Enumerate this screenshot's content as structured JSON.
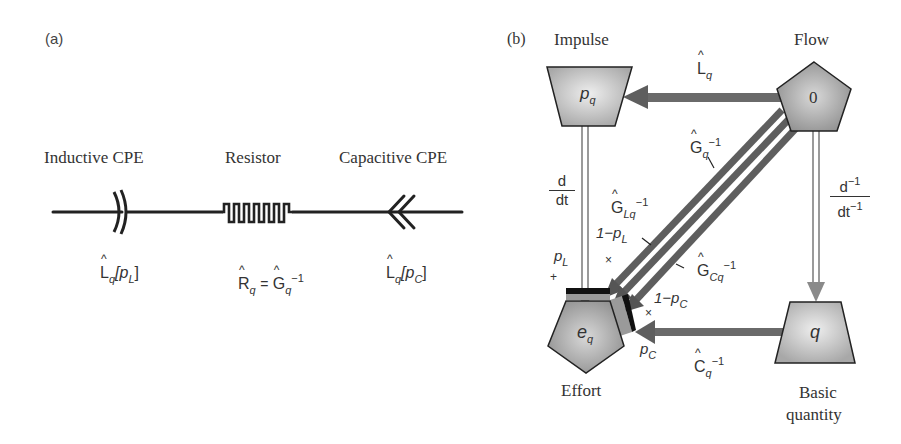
{
  "panel_a": {
    "label": "(a)",
    "elements": [
      {
        "title": "Inductive CPE",
        "symbol": "inductive-cpe",
        "expr_base": "L",
        "expr_sub": "q",
        "expr_arg": "[p",
        "expr_arg_sub": "L",
        "expr_close": "]"
      },
      {
        "title": "Resistor",
        "symbol": "resistor",
        "expr_lhs": "R",
        "expr_lhs_sub": "q",
        "expr_eq": "=",
        "expr_rhs": "G",
        "expr_rhs_sub": "q",
        "expr_rhs_sup": "−1"
      },
      {
        "title": "Capacitive CPE",
        "symbol": "capacitive-cpe",
        "expr_base": "L",
        "expr_sub": "q",
        "expr_arg": "[p",
        "expr_arg_sub": "C",
        "expr_close": "]"
      }
    ]
  },
  "panel_b": {
    "label": "(b)",
    "nodes": {
      "impulse": {
        "title": "Impulse",
        "symbol": "p",
        "symbol_sub": "q",
        "shape": "inverted-trapezoid"
      },
      "flow": {
        "title": "Flow",
        "symbol": "0",
        "shape": "pentagon"
      },
      "effort": {
        "title": "Effort",
        "symbol": "e",
        "symbol_sub": "q",
        "shape": "pentagon"
      },
      "basic_quantity": {
        "title_line1": "Basic",
        "title_line2": "quantity",
        "symbol": "q",
        "shape": "trapezoid"
      }
    },
    "edges": {
      "flow_to_impulse": {
        "op": "L",
        "op_sub": "q"
      },
      "impulse_to_effort": {
        "num": "d",
        "den": "dt"
      },
      "flow_to_basic": {
        "num": "d",
        "num_sup": "−1",
        "den": "dt",
        "den_sup": "−1"
      },
      "basic_to_effort": {
        "op": "C",
        "op_sub": "q",
        "op_sup": "−1"
      },
      "diag_main": {
        "op": "G",
        "op_sub": "q",
        "op_sup": "−1"
      },
      "diag_L": {
        "op": "G",
        "op_sub": "Lq",
        "op_sup": "−1"
      },
      "diag_C": {
        "op": "G",
        "op_sub": "Cq",
        "op_sup": "−1"
      }
    },
    "weights": {
      "one_minus_pL": "1−p",
      "one_minus_pL_sub": "L",
      "pL": "p",
      "pL_sub": "L",
      "one_minus_pC": "1−p",
      "one_minus_pC_sub": "C",
      "pC": "p",
      "pC_sub": "C",
      "times": "×",
      "plus": "+"
    }
  },
  "colors": {
    "line": "#222222",
    "arrow": "#6e6e6e",
    "arrow_light": "#9a9a9a",
    "node_fill": "#bdbdbd",
    "node_fill_light": "#e6e6e6",
    "node_stroke": "#222222"
  }
}
